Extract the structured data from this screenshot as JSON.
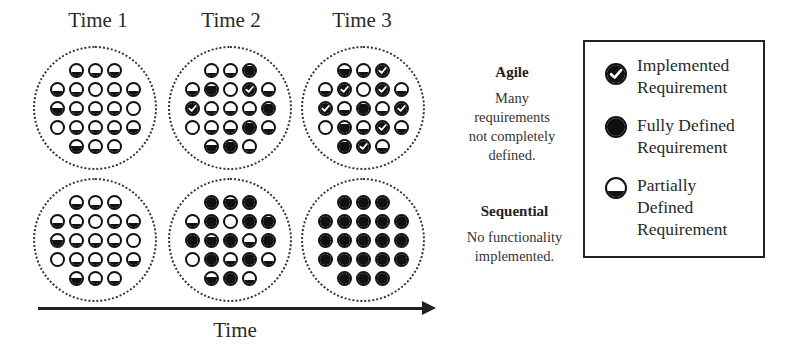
{
  "columns": [
    {
      "title": "Time 1"
    },
    {
      "title": "Time 2"
    },
    {
      "title": "Time 3"
    }
  ],
  "rows": [
    {
      "name": "agile",
      "heading": "Agile",
      "description": [
        "Many",
        "requirements",
        "not completely",
        "defined."
      ]
    },
    {
      "name": "sequential",
      "heading": "Sequential",
      "description": [
        "No functionality",
        "implemented."
      ]
    }
  ],
  "x_axis": {
    "label": "Time",
    "direction": "right"
  },
  "legend": {
    "items": [
      {
        "icon": "check-circle-icon",
        "type": "implemented",
        "lines": [
          "Implemented",
          "Requirement"
        ]
      },
      {
        "icon": "filled-circle-icon",
        "type": "fully_defined",
        "lines": [
          "Fully Defined",
          "Requirement"
        ]
      },
      {
        "icon": "half-circle-icon",
        "type": "partially_defined",
        "lines": [
          "Partially",
          "Defined",
          "Requirement"
        ]
      }
    ]
  },
  "grid_layout": {
    "row_counts": [
      3,
      5,
      5,
      5,
      3
    ],
    "fill_note": "f = fraction filled from bottom (0 empty, 1 full); c = implemented (check)"
  },
  "pools": {
    "agile": [
      [
        [
          {
            "f": 0.3
          },
          {
            "f": 0.25
          },
          {
            "f": 0.3
          }
        ],
        [
          {
            "f": 0.3
          },
          {
            "f": 0.25
          },
          {
            "f": 0.0
          },
          {
            "f": 0.2
          },
          {
            "f": 0.3
          }
        ],
        [
          {
            "f": 0.5
          },
          {
            "f": 0.25
          },
          {
            "f": 0.2
          },
          {
            "f": 0.25
          },
          {
            "f": 0.0
          }
        ],
        [
          {
            "f": 0.0
          },
          {
            "f": 0.25
          },
          {
            "f": 0.2
          },
          {
            "f": 0.2
          },
          {
            "f": 0.3
          }
        ],
        [
          {
            "f": 0.5
          },
          {
            "f": 0.25
          },
          {
            "f": 0.25
          }
        ]
      ],
      [
        [
          {
            "f": 0.25
          },
          {
            "f": 0.25
          },
          {
            "f": 0.85
          }
        ],
        [
          {
            "f": 0.3
          },
          {
            "f": 0.8
          },
          {
            "f": 0.0
          },
          {
            "f": 1,
            "c": true
          },
          {
            "f": 0.3
          }
        ],
        [
          {
            "f": 1,
            "c": true
          },
          {
            "f": 0.25
          },
          {
            "f": 0.25
          },
          {
            "f": 0.2
          },
          {
            "f": 0.85
          }
        ],
        [
          {
            "f": 0.0
          },
          {
            "f": 0.25
          },
          {
            "f": 0.3
          },
          {
            "f": 0.85
          },
          {
            "f": 0.3
          }
        ],
        [
          {
            "f": 0.55
          },
          {
            "f": 0.9
          },
          {
            "f": 0.25
          }
        ]
      ],
      [
        [
          {
            "f": 0.55
          },
          {
            "f": 0.3
          },
          {
            "f": 1,
            "c": true
          }
        ],
        [
          {
            "f": 0.3
          },
          {
            "f": 1,
            "c": true
          },
          {
            "f": 0.0
          },
          {
            "f": 1,
            "c": true
          },
          {
            "f": 0.3
          }
        ],
        [
          {
            "f": 1,
            "c": true
          },
          {
            "f": 0.3
          },
          {
            "f": 0.85
          },
          {
            "f": 0.25
          },
          {
            "f": 1,
            "c": true
          }
        ],
        [
          {
            "f": 0.0
          },
          {
            "f": 0.8
          },
          {
            "f": 0.3
          },
          {
            "f": 1,
            "c": true
          },
          {
            "f": 0.3
          }
        ],
        [
          {
            "f": 0.85
          },
          {
            "f": 1,
            "c": true
          },
          {
            "f": 0.3
          }
        ]
      ]
    ],
    "sequential": [
      [
        [
          {
            "f": 0.3
          },
          {
            "f": 0.25
          },
          {
            "f": 0.3
          }
        ],
        [
          {
            "f": 0.3
          },
          {
            "f": 0.25
          },
          {
            "f": 0.0
          },
          {
            "f": 0.2
          },
          {
            "f": 0.3
          }
        ],
        [
          {
            "f": 0.5
          },
          {
            "f": 0.25
          },
          {
            "f": 0.2
          },
          {
            "f": 0.25
          },
          {
            "f": 0.0
          }
        ],
        [
          {
            "f": 0.0
          },
          {
            "f": 0.25
          },
          {
            "f": 0.2
          },
          {
            "f": 0.2
          },
          {
            "f": 0.3
          }
        ],
        [
          {
            "f": 0.5
          },
          {
            "f": 0.25
          },
          {
            "f": 0.25
          }
        ]
      ],
      [
        [
          {
            "f": 1
          },
          {
            "f": 0.8
          },
          {
            "f": 1
          }
        ],
        [
          {
            "f": 0.35
          },
          {
            "f": 1
          },
          {
            "f": 0.0
          },
          {
            "f": 1
          },
          {
            "f": 0.85
          }
        ],
        [
          {
            "f": 1
          },
          {
            "f": 0.8
          },
          {
            "f": 1
          },
          {
            "f": 0.35
          },
          {
            "f": 1
          }
        ],
        [
          {
            "f": 0.0
          },
          {
            "f": 1
          },
          {
            "f": 0.35
          },
          {
            "f": 1
          },
          {
            "f": 0.35
          }
        ],
        [
          {
            "f": 0.55
          },
          {
            "f": 1
          },
          {
            "f": 0.3
          }
        ]
      ],
      [
        [
          {
            "f": 1
          },
          {
            "f": 1
          },
          {
            "f": 1
          }
        ],
        [
          {
            "f": 1
          },
          {
            "f": 1
          },
          {
            "f": 1
          },
          {
            "f": 1
          },
          {
            "f": 1
          }
        ],
        [
          {
            "f": 1
          },
          {
            "f": 1
          },
          {
            "f": 1
          },
          {
            "f": 1
          },
          {
            "f": 1
          }
        ],
        [
          {
            "f": 1
          },
          {
            "f": 1
          },
          {
            "f": 1
          },
          {
            "f": 1
          },
          {
            "f": 1
          }
        ],
        [
          {
            "f": 1
          },
          {
            "f": 1
          },
          {
            "f": 1
          }
        ]
      ]
    ]
  }
}
